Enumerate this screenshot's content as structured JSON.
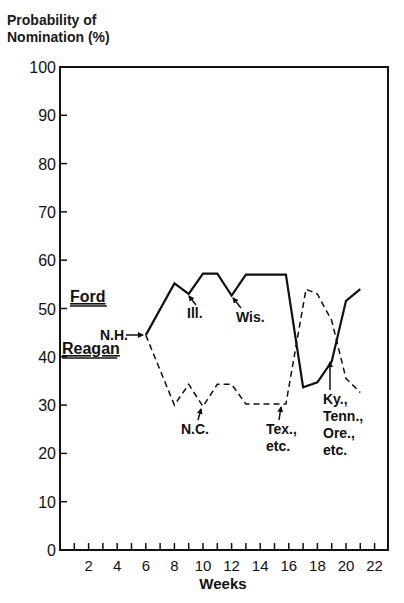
{
  "chart_data": {
    "type": "line",
    "title": "",
    "ylabel": "Probability of Nomination (%)",
    "ylabel_lines": [
      "Probability of",
      "Nomination (%)"
    ],
    "xlabel": "Weeks",
    "xlim": [
      0,
      23
    ],
    "ylim": [
      0,
      100
    ],
    "grid": false,
    "x_ticks": [
      2,
      4,
      6,
      8,
      10,
      12,
      14,
      16,
      18,
      20,
      22
    ],
    "x_minor_ticks": [
      1,
      3,
      5,
      7,
      9,
      11,
      13,
      15,
      17,
      19,
      21
    ],
    "y_ticks": [
      0,
      10,
      20,
      30,
      40,
      50,
      60,
      70,
      80,
      90,
      100
    ],
    "series": [
      {
        "name": "Ford",
        "style": "solid",
        "x": [
          6,
          8,
          9,
          10,
          11,
          12,
          13,
          15.8,
          17,
          18,
          19,
          20,
          21
        ],
        "values": [
          44.5,
          55.2,
          53,
          57.2,
          57.2,
          52.7,
          57,
          57,
          33.7,
          34.7,
          39,
          51.6,
          54
        ]
      },
      {
        "name": "Reagan",
        "style": "dashed",
        "x": [
          6,
          8,
          9,
          10,
          11,
          12,
          13,
          15.8,
          17.2,
          18,
          19,
          20,
          21
        ],
        "values": [
          44.5,
          30,
          34.3,
          29.7,
          34.3,
          34.3,
          30.2,
          30.2,
          54,
          53,
          47.5,
          35.5,
          32.6
        ]
      }
    ],
    "legend": [
      {
        "label": "Ford",
        "x": 70,
        "y": 302
      },
      {
        "label": "Reagan",
        "x": 62,
        "y": 354
      }
    ],
    "annotations": [
      {
        "text": [
          "N.H."
        ],
        "label_x": 100,
        "label_y": 340,
        "arrow_from": [
          126,
          335
        ],
        "arrow_to": [
          143,
          335
        ]
      },
      {
        "text": [
          "Ill."
        ],
        "label_x": 187,
        "label_y": 318,
        "arrow_from": [
          196,
          305
        ],
        "arrow_to": [
          189,
          296
        ]
      },
      {
        "text": [
          "Wis."
        ],
        "label_x": 236,
        "label_y": 322,
        "arrow_from": [
          241,
          308
        ],
        "arrow_to": [
          233,
          298
        ]
      },
      {
        "text": [
          "N.C."
        ],
        "label_x": 181,
        "label_y": 434,
        "arrow_from": [
          198,
          420
        ],
        "arrow_to": [
          201,
          409
        ]
      },
      {
        "text": [
          "Tex.,",
          "etc."
        ],
        "label_x": 266,
        "label_y": 434,
        "arrow_from": [
          279,
          420
        ],
        "arrow_to": [
          281,
          407
        ]
      },
      {
        "text": [
          "Ky.,",
          "Tenn.,",
          "Ore.,",
          "etc."
        ],
        "label_x": 323,
        "label_y": 404,
        "arrow_from": [
          330,
          390
        ],
        "arrow_to": [
          330,
          362
        ]
      }
    ]
  }
}
